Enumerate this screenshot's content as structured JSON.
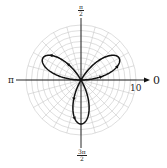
{
  "chart_data": {
    "type": "polar-line",
    "title": "",
    "equation": "r = 8 sin(3θ)",
    "series": [
      {
        "name": "three-petal rose",
        "a": 8,
        "k": 3,
        "theta_range": [
          0,
          3.14159
        ],
        "petal_tips_deg": [
          30,
          150,
          270
        ],
        "petal_length": 8,
        "direction_arrows": true
      }
    ],
    "r_max": 10,
    "r_grid": [
      1,
      2,
      3,
      4,
      5,
      6,
      7,
      8,
      9,
      10
    ],
    "theta_grid_step_deg": 15,
    "grid": true,
    "axis_labels": {
      "theta_0": "0",
      "theta_half_pi_num": "π",
      "theta_half_pi_den": "2",
      "theta_pi": "π",
      "theta_three_half_pi_num": "3π",
      "theta_three_half_pi_den": "2",
      "r_tick": "10"
    }
  },
  "colors": {
    "grid": "#c8c8c8",
    "axis": "#111111",
    "curve": "#111111"
  }
}
